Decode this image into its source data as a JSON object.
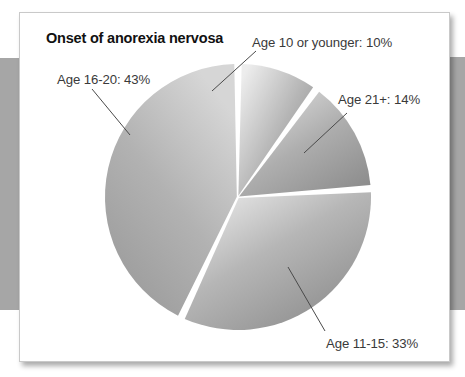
{
  "figure": {
    "title": "Onset of anorexia nervosa",
    "background_color": "#ffffff",
    "band_color": "#a6a6a6",
    "card_border_color": "#c9c9c9"
  },
  "chart_data": {
    "type": "pie",
    "title": "Onset of anorexia nervosa",
    "xlabel": "",
    "ylabel": "",
    "legend_position": "none",
    "grid": false,
    "units": "percent",
    "total": 100,
    "start_angle_deg": 0,
    "direction": "clockwise",
    "categories": [
      "Age 10 or younger",
      "Age 21+",
      "Age 11-15",
      "Age 16-20"
    ],
    "values": [
      10,
      14,
      33,
      43
    ],
    "labels": [
      "Age 10 or younger: 10%",
      "Age 21+: 14%",
      "Age 11-15: 33%",
      "Age 16-20: 43%"
    ],
    "slices": [
      {
        "name": "Age 10 or younger",
        "value": 10,
        "label": "Age 10 or younger: 10%",
        "start_deg": 0,
        "end_deg": 36,
        "fill_light": "#e6e6e6",
        "fill_dark": "#8f8f8f"
      },
      {
        "name": "Age 21+",
        "value": 14,
        "label": "Age 21+: 14%",
        "start_deg": 36,
        "end_deg": 86.4,
        "fill_light": "#e3e3e3",
        "fill_dark": "#8c8c8c"
      },
      {
        "name": "Age 11-15",
        "value": 33,
        "label": "Age 11-15: 33%",
        "start_deg": 86.4,
        "end_deg": 205.2,
        "fill_light": "#ededed",
        "fill_dark": "#8a8a8a"
      },
      {
        "name": "Age 16-20",
        "value": 43,
        "label": "Age 16-20: 43%",
        "start_deg": 205.2,
        "end_deg": 360,
        "fill_light": "#d9d9d9",
        "fill_dark": "#9a9a9a"
      }
    ],
    "geometry": {
      "center_x": 218,
      "center_y": 184,
      "radius": 133,
      "gap_deg": 1.6
    }
  }
}
